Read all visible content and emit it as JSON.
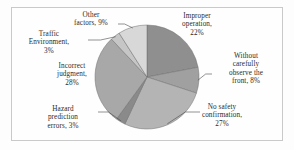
{
  "chart_data": {
    "type": "pie",
    "title": "",
    "subtitle": "",
    "xlabel": "",
    "ylabel": "",
    "legend_position": "none",
    "grid": false,
    "labels_outside": true,
    "start_angle_deg": 0,
    "direction": "clockwise",
    "categories": [
      "Improper operation",
      "Without carefully observe the front",
      "No safety confirmation",
      "Hazard prediction errors",
      "Incorrect judgment",
      "Traffic Environment",
      "Other factors"
    ],
    "values": [
      22,
      8,
      27,
      3,
      28,
      3,
      9
    ],
    "units": "%",
    "total": 100,
    "slices": [
      {
        "name": "Improper operation",
        "value": 22,
        "label": "Improper\noperation,\n22%",
        "color": "#8f8f8f",
        "leader": false
      },
      {
        "name": "Without carefully observe the front",
        "value": 8,
        "label": "Without\ncarefully\nobserve the\nfront, 8%",
        "color": "#a0a0a0",
        "leader": true
      },
      {
        "name": "No safety confirmation",
        "value": 27,
        "label": "No safety\nconfirmation,\n27%",
        "color": "#b4b4b4",
        "leader": true
      },
      {
        "name": "Hazard prediction errors",
        "value": 3,
        "label": "Hazard\nprediction\nerrors, 3%",
        "color": "#8a8a8a",
        "leader": true
      },
      {
        "name": "Incorrect judgment",
        "value": 28,
        "label": "Incorrect\njudgment,\n28%",
        "color": "#a8a8a8",
        "leader": false
      },
      {
        "name": "Traffic Environment",
        "value": 3,
        "label": "Traffic\nEnvironment,\n3%",
        "color": "#c6c6c6",
        "leader": true
      },
      {
        "name": "Other factors",
        "value": 9,
        "label": "Other\nfactors, 9%",
        "color": "#d8d8d8",
        "leader": true
      }
    ],
    "geometry": {
      "center_x": 147,
      "center_y": 77,
      "radius": 52
    },
    "style": {
      "background": "#fdfdfd",
      "border_color": "#c9c9c9",
      "slice_edge_color": "#6f6f6f",
      "leader_color": "#4a4a4a",
      "text_color": "#2b2b2b"
    }
  }
}
